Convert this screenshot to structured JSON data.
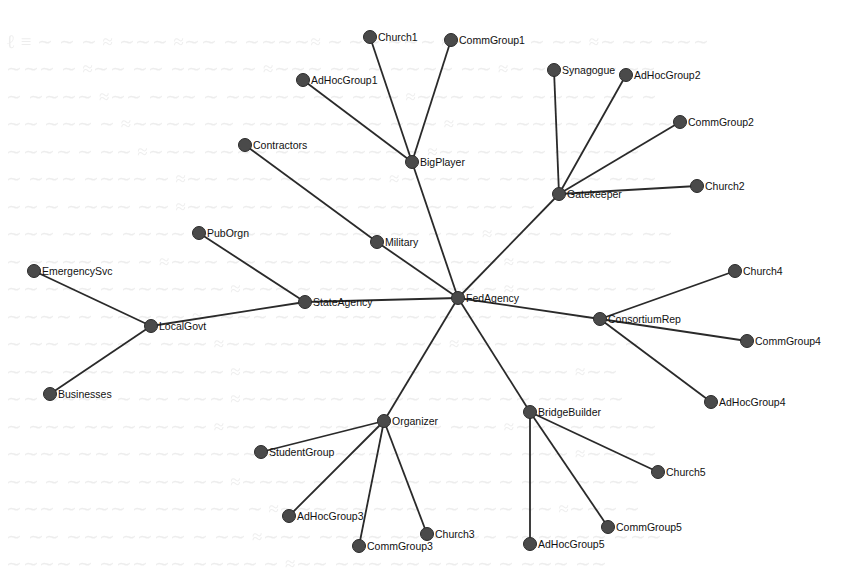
{
  "diagram": {
    "type": "network",
    "colors": {
      "edge": "#2a2a2a",
      "node": "#4a4a4a",
      "label": "#111111",
      "background": "#ffffff"
    },
    "nodes": [
      {
        "id": "FedAgency",
        "label": "FedAgency",
        "x": 458,
        "y": 298
      },
      {
        "id": "BigPlayer",
        "label": "BigPlayer",
        "x": 412,
        "y": 162
      },
      {
        "id": "Church1",
        "label": "Church1",
        "x": 370,
        "y": 37
      },
      {
        "id": "CommGroup1",
        "label": "CommGroup1",
        "x": 451,
        "y": 40
      },
      {
        "id": "AdHocGroup1",
        "label": "AdHocGroup1",
        "x": 303,
        "y": 80
      },
      {
        "id": "Military",
        "label": "Military",
        "x": 377,
        "y": 242
      },
      {
        "id": "Contractors",
        "label": "Contractors",
        "x": 245,
        "y": 145
      },
      {
        "id": "StateAgency",
        "label": "StateAgency",
        "x": 305,
        "y": 302
      },
      {
        "id": "PubOrgn",
        "label": "PubOrgn",
        "x": 199,
        "y": 233
      },
      {
        "id": "LocalGovt",
        "label": "LocalGovt",
        "x": 151,
        "y": 326
      },
      {
        "id": "EmergencySvc",
        "label": "EmergencySvc",
        "x": 34,
        "y": 271
      },
      {
        "id": "Businesses",
        "label": "Businesses",
        "x": 50,
        "y": 394
      },
      {
        "id": "Gatekeeper",
        "label": "Gatekeeper",
        "x": 559,
        "y": 194
      },
      {
        "id": "Synagogue",
        "label": "Synagogue",
        "x": 554,
        "y": 70
      },
      {
        "id": "AdHocGroup2",
        "label": "AdHocGroup2",
        "x": 626,
        "y": 75
      },
      {
        "id": "CommGroup2",
        "label": "CommGroup2",
        "x": 680,
        "y": 122
      },
      {
        "id": "Church2",
        "label": "Church2",
        "x": 697,
        "y": 186
      },
      {
        "id": "ConsortiumRep",
        "label": "ConsortiumRep",
        "x": 600,
        "y": 319
      },
      {
        "id": "Church4",
        "label": "Church4",
        "x": 735,
        "y": 271
      },
      {
        "id": "CommGroup4",
        "label": "CommGroup4",
        "x": 747,
        "y": 341
      },
      {
        "id": "AdHocGroup4",
        "label": "AdHocGroup4",
        "x": 711,
        "y": 402
      },
      {
        "id": "Organizer",
        "label": "Organizer",
        "x": 384,
        "y": 421
      },
      {
        "id": "StudentGroup",
        "label": "StudentGroup",
        "x": 261,
        "y": 452
      },
      {
        "id": "AdHocGroup3",
        "label": "AdHocGroup3",
        "x": 289,
        "y": 516
      },
      {
        "id": "CommGroup3",
        "label": "CommGroup3",
        "x": 359,
        "y": 546
      },
      {
        "id": "Church3",
        "label": "Church3",
        "x": 427,
        "y": 534
      },
      {
        "id": "BridgeBuilder",
        "label": "BridgeBuilder",
        "x": 530,
        "y": 412
      },
      {
        "id": "Church5",
        "label": "Church5",
        "x": 658,
        "y": 472
      },
      {
        "id": "CommGroup5",
        "label": "CommGroup5",
        "x": 608,
        "y": 527
      },
      {
        "id": "AdHocGroup5",
        "label": "AdHocGroup5",
        "x": 530,
        "y": 544
      }
    ],
    "edges": [
      [
        "FedAgency",
        "BigPlayer"
      ],
      [
        "FedAgency",
        "Military"
      ],
      [
        "FedAgency",
        "StateAgency"
      ],
      [
        "FedAgency",
        "Gatekeeper"
      ],
      [
        "FedAgency",
        "ConsortiumRep"
      ],
      [
        "FedAgency",
        "Organizer"
      ],
      [
        "FedAgency",
        "BridgeBuilder"
      ],
      [
        "BigPlayer",
        "Church1"
      ],
      [
        "BigPlayer",
        "CommGroup1"
      ],
      [
        "BigPlayer",
        "AdHocGroup1"
      ],
      [
        "Military",
        "Contractors"
      ],
      [
        "StateAgency",
        "PubOrgn"
      ],
      [
        "StateAgency",
        "LocalGovt"
      ],
      [
        "LocalGovt",
        "EmergencySvc"
      ],
      [
        "LocalGovt",
        "Businesses"
      ],
      [
        "Gatekeeper",
        "Synagogue"
      ],
      [
        "Gatekeeper",
        "AdHocGroup2"
      ],
      [
        "Gatekeeper",
        "CommGroup2"
      ],
      [
        "Gatekeeper",
        "Church2"
      ],
      [
        "ConsortiumRep",
        "Church4"
      ],
      [
        "ConsortiumRep",
        "CommGroup4"
      ],
      [
        "ConsortiumRep",
        "AdHocGroup4"
      ],
      [
        "Organizer",
        "StudentGroup"
      ],
      [
        "Organizer",
        "AdHocGroup3"
      ],
      [
        "Organizer",
        "CommGroup3"
      ],
      [
        "Organizer",
        "Church3"
      ],
      [
        "BridgeBuilder",
        "Church5"
      ],
      [
        "BridgeBuilder",
        "CommGroup5"
      ],
      [
        "BridgeBuilder",
        "AdHocGroup5"
      ]
    ]
  }
}
